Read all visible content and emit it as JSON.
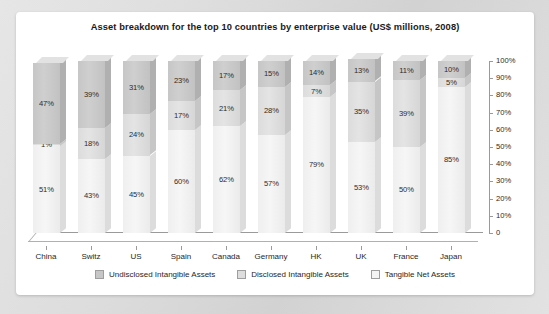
{
  "panel": {
    "title": "Asset breakdown for the top 10 countries by enterprise value (US$ millions, 2008)"
  },
  "chart_data": {
    "type": "bar",
    "stacked": true,
    "orientation": "vertical",
    "three_d": true,
    "title": "Asset breakdown for the top 10 countries by enterprise value (US$ millions, 2008)",
    "xlabel": "",
    "ylabel": "",
    "ylim": [
      0,
      100
    ],
    "yunit": "%",
    "grid": false,
    "legend_position": "bottom",
    "axis_position": "right",
    "categories": [
      "China",
      "Switz",
      "US",
      "Spain",
      "Canada",
      "Germany",
      "HK",
      "UK",
      "France",
      "Japan"
    ],
    "ticks": [
      "0",
      "10%",
      "20%",
      "30%",
      "40%",
      "50%",
      "60%",
      "70%",
      "80%",
      "90%",
      "100%"
    ],
    "tick_values": [
      0,
      10,
      20,
      30,
      40,
      50,
      60,
      70,
      80,
      90,
      100
    ],
    "series": [
      {
        "name": "Undisclosed Intangible Assets",
        "color": "#c6c6c6",
        "values": [
          47,
          39,
          31,
          23,
          17,
          15,
          14,
          13,
          11,
          10
        ],
        "labels": [
          "47%",
          "39%",
          "31%",
          "23%",
          "17%",
          "15%",
          "14%",
          "13%",
          "11%",
          "10%"
        ]
      },
      {
        "name": "Disclosed Intangible Assets",
        "color": "#dddddd",
        "values": [
          1,
          18,
          24,
          17,
          21,
          28,
          7,
          35,
          39,
          5
        ],
        "labels": [
          "1%",
          "18%",
          "24%",
          "17%",
          "21%",
          "28%",
          "7%",
          "35%",
          "39%",
          "5%"
        ]
      },
      {
        "name": "Tangible Net Assets",
        "color": "#f4f4f4",
        "values": [
          51,
          43,
          45,
          60,
          62,
          57,
          79,
          53,
          50,
          85
        ],
        "labels": [
          "51%",
          "43%",
          "45%",
          "60%",
          "62%",
          "57%",
          "79%",
          "53%",
          "50%",
          "85%"
        ]
      }
    ]
  },
  "legend": {
    "items": [
      {
        "label": "Undisclosed Intangible Assets",
        "key": "undisclosed"
      },
      {
        "label": "Disclosed Intangible Assets",
        "key": "disclosed"
      },
      {
        "label": "Tangible Net Assets",
        "key": "tangible"
      }
    ]
  }
}
